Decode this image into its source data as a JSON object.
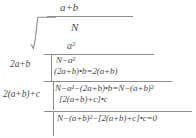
{
  "diagram": {
    "kind": "square-root-long-division",
    "quotient": "a+b",
    "radicand": "N",
    "radical_symbol": "sqrt-radical-icon",
    "first_subtrahend": "a²",
    "divisors": [
      {
        "label": "2a+b"
      },
      {
        "label": "2(a+b)+c"
      }
    ],
    "steps": [
      {
        "id": "remainder-1",
        "text": "N−a²"
      },
      {
        "id": "product-1",
        "text": "(2a+b)•b=2(a+b)"
      },
      {
        "id": "remainder-2",
        "text": "N−a²−(2a+b)•b=N−(a+b)²"
      },
      {
        "id": "product-2",
        "text": "[2(a+b)+c]•c"
      },
      {
        "id": "remainder-3",
        "text": "N−(a+b)²−[2(a+b)+c]•c=0"
      }
    ]
  },
  "colors": {
    "ink": "#4a4a4a",
    "rule": "#8d8d8d",
    "background": "#ffffff"
  }
}
